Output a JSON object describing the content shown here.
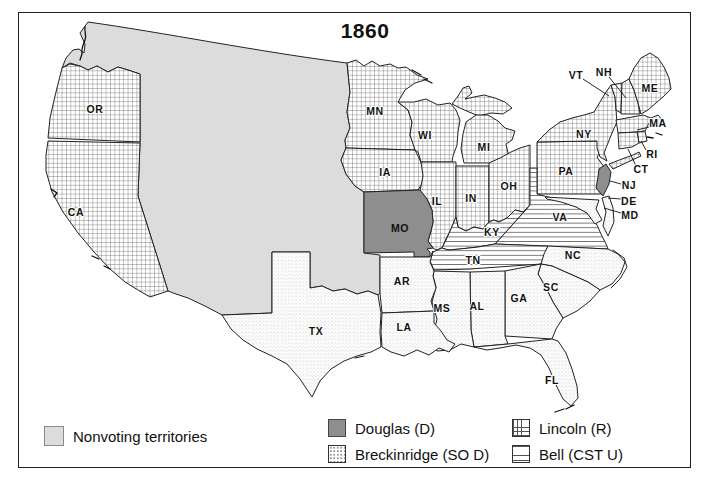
{
  "title": "1860",
  "legend": {
    "nonvoting_label": "Nonvoting territories",
    "items": [
      {
        "id": "douglas",
        "label": "Douglas (D)",
        "swatch": "solid-dark-gray"
      },
      {
        "id": "breckinridge",
        "label": "Breckinridge (SO D)",
        "swatch": "stipple-dots"
      },
      {
        "id": "lincoln",
        "label": "Lincoln (R)",
        "swatch": "crosshatch-grid"
      },
      {
        "id": "bell",
        "label": "Bell (CST U)",
        "swatch": "horizontal-lines"
      }
    ]
  },
  "colors": {
    "douglas_fill": "#8e8e8e",
    "territory_fill": "#dcdcdc",
    "pattern_line": "#555555",
    "state_outline": "#222222",
    "text": "#111111"
  },
  "map": {
    "labels": {
      "OR": "OR",
      "CA": "CA",
      "MN": "MN",
      "WI": "WI",
      "IA": "IA",
      "MO": "MO",
      "IL": "IL",
      "IN": "IN",
      "OH": "OH",
      "MI": "MI",
      "PA": "PA",
      "NY": "NY",
      "VT": "VT",
      "NH": "NH",
      "ME": "ME",
      "MA": "MA",
      "RI": "RI",
      "CT": "CT",
      "NJ": "NJ",
      "DE": "DE",
      "MD": "MD",
      "VA": "VA",
      "KY": "KY",
      "TN": "TN",
      "NC": "NC",
      "SC": "SC",
      "GA": "GA",
      "AL": "AL",
      "MS": "MS",
      "AR": "AR",
      "LA": "LA",
      "TX": "TX",
      "FL": "FL"
    },
    "state_fill": {
      "lincoln_crosshatch": [
        "OR",
        "CA",
        "MN",
        "WI",
        "IA",
        "IL",
        "IN",
        "MI",
        "OH",
        "PA",
        "NY",
        "VT",
        "NH",
        "ME",
        "MA",
        "RI",
        "CT"
      ],
      "douglas_solid": [
        "MO",
        "NJ"
      ],
      "bell_horizontal_lines": [
        "VA",
        "KY",
        "TN"
      ],
      "breckinridge_dots": [
        "TX",
        "AR",
        "LA",
        "MS",
        "AL",
        "GA",
        "FL",
        "SC",
        "NC",
        "DE",
        "MD"
      ],
      "nonvoting_gray": [
        "western territories"
      ]
    }
  }
}
